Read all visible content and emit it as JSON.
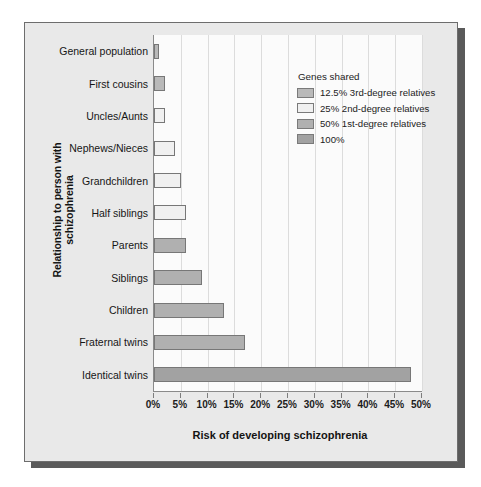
{
  "chart_data": {
    "type": "bar",
    "orientation": "horizontal",
    "title": "",
    "xlabel": "Risk of developing schizophrenia",
    "ylabel": "Relationship to person with schizophrenia",
    "xlim": [
      0,
      50
    ],
    "xtick_labels": [
      "0%",
      "5%",
      "10%",
      "15%",
      "20%",
      "25%",
      "30%",
      "35%",
      "40%",
      "45%",
      "50%"
    ],
    "xtick_values": [
      0,
      5,
      10,
      15,
      20,
      25,
      30,
      35,
      40,
      45,
      50
    ],
    "grid": true,
    "legend_position": "upper right",
    "categories": [
      "General population",
      "First cousins",
      "Uncles/Aunts",
      "Nephews/Nieces",
      "Grandchildren",
      "Half siblings",
      "Parents",
      "Siblings",
      "Children",
      "Fraternal twins",
      "Identical twins"
    ],
    "values": [
      1,
      2,
      2,
      4,
      5,
      6,
      6,
      9,
      13,
      17,
      48
    ],
    "bar_groups": [
      "12.5% 3rd-degree relatives",
      "12.5% 3rd-degree relatives",
      "25% 2nd-degree relatives",
      "25% 2nd-degree relatives",
      "25% 2nd-degree relatives",
      "25% 2nd-degree relatives",
      "50% 1st-degree relatives",
      "50% 1st-degree relatives",
      "50% 1st-degree relatives",
      "50% 1st-degree relatives",
      "100%"
    ],
    "bars": [
      {
        "label": "General population",
        "value": 1,
        "level": 1
      },
      {
        "label": "First cousins",
        "value": 2,
        "level": 1
      },
      {
        "label": "Uncles/Aunts",
        "value": 2,
        "level": 2
      },
      {
        "label": "Nephews/Nieces",
        "value": 4,
        "level": 2
      },
      {
        "label": "Grandchildren",
        "value": 5,
        "level": 2
      },
      {
        "label": "Half siblings",
        "value": 6,
        "level": 2
      },
      {
        "label": "Parents",
        "value": 6,
        "level": 3
      },
      {
        "label": "Siblings",
        "value": 9,
        "level": 3
      },
      {
        "label": "Children",
        "value": 13,
        "level": 3
      },
      {
        "label": "Fraternal twins",
        "value": 17,
        "level": 3
      },
      {
        "label": "Identical twins",
        "value": 48,
        "level": 4
      }
    ],
    "legend": {
      "title": "Genes shared",
      "entries": [
        {
          "label": "12.5% 3rd-degree relatives",
          "level": 1,
          "color": "#b9b9b9"
        },
        {
          "label": "25% 2nd-degree relatives",
          "level": 2,
          "color": "#f0f0f0"
        },
        {
          "label": "50% 1st-degree relatives",
          "level": 3,
          "color": "#b0b0b0"
        },
        {
          "label": "100%",
          "level": 4,
          "color": "#a2a2a2"
        }
      ]
    },
    "colors": {
      "panel_background": "#e9e9e9",
      "plot_background": "#fbfbfb",
      "axis": "#8a8a8a",
      "gridline": "#dcdcdc",
      "bar_border": "#777777",
      "text": "#141414",
      "shadow": "#5a5a5a"
    }
  }
}
